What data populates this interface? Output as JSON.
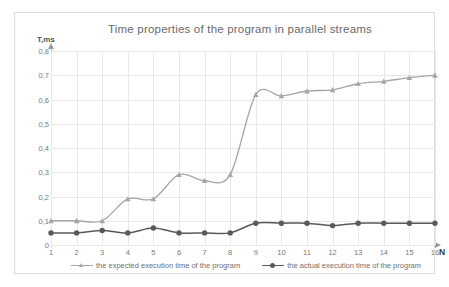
{
  "chart_data": {
    "type": "line",
    "title": "Time properties of the program in parallel streams",
    "xlabel": "N",
    "ylabel": "T,ms",
    "x": [
      1,
      2,
      3,
      4,
      5,
      6,
      7,
      8,
      9,
      10,
      11,
      12,
      13,
      14,
      15,
      16
    ],
    "xticklabels": [
      "1",
      "2",
      "3",
      "4",
      "5",
      "6",
      "7",
      "8",
      "9",
      "10",
      "11",
      "12",
      "13",
      "14",
      "15",
      "16"
    ],
    "yticklabels": [
      "0",
      "0,1",
      "0,2",
      "0,3",
      "0,4",
      "0,5",
      "0,6",
      "0,7",
      "0,8"
    ],
    "ytickvalues": [
      0,
      0.1,
      0.2,
      0.3,
      0.4,
      0.5,
      0.6,
      0.7,
      0.8
    ],
    "ylim": [
      0,
      0.8
    ],
    "xlim": [
      1,
      16
    ],
    "grid": true,
    "legend_position": "bottom",
    "series": [
      {
        "name": "the expected execution time of the program",
        "color": "#a6a6a6",
        "marker": "triangle",
        "values": [
          0.1,
          0.1,
          0.1,
          0.19,
          0.19,
          0.29,
          0.265,
          0.29,
          0.62,
          0.615,
          0.635,
          0.64,
          0.665,
          0.675,
          0.69,
          0.7
        ]
      },
      {
        "name": "the actual execution time of the program",
        "color": "#595959",
        "marker": "circle",
        "values": [
          0.05,
          0.05,
          0.06,
          0.05,
          0.07,
          0.05,
          0.05,
          0.05,
          0.09,
          0.09,
          0.09,
          0.08,
          0.09,
          0.09,
          0.09,
          0.09
        ]
      }
    ]
  },
  "colors": {
    "expected": "#a6a6a6",
    "actual": "#595959",
    "grid": "#e8e8e8",
    "axis": "#bfbfbf",
    "title_text": "#6a6a6a",
    "tick_text": "#7a7a7a",
    "frame_border": "#dcdcdc",
    "background": "#ffffff"
  }
}
